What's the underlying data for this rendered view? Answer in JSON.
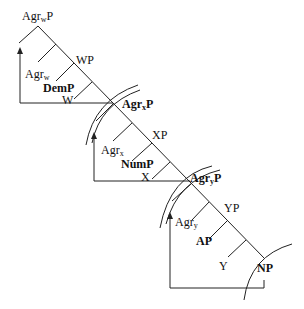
{
  "diagram": {
    "type": "syntax-tree",
    "nodes": {
      "agrw_phrase": {
        "base": "Agr",
        "sub": "w",
        "tail": "P",
        "bold": false
      },
      "wp": {
        "text": "WP",
        "bold": false
      },
      "agrw_head": {
        "base": "Agr",
        "sub": "w",
        "bold": false
      },
      "demp": {
        "text": "DemP",
        "bold": true
      },
      "w_head": {
        "text": "W",
        "bold": false
      },
      "agrx_phrase": {
        "base": "Agr",
        "sub": "x",
        "tail": "P",
        "bold": true
      },
      "xp": {
        "text": "XP",
        "bold": false
      },
      "agrx_head": {
        "base": "Agr",
        "sub": "x",
        "bold": false
      },
      "nump": {
        "text": "NumP",
        "bold": true
      },
      "x_head": {
        "text": "X",
        "bold": false
      },
      "agry_phrase": {
        "base": "Agr",
        "sub": "y",
        "tail": "P",
        "bold": true
      },
      "yp": {
        "text": "YP",
        "bold": false
      },
      "agry_head": {
        "base": "Agr",
        "sub": "y",
        "bold": false
      },
      "ap": {
        "text": "AP",
        "bold": true
      },
      "y_head": {
        "text": "Y",
        "bold": false
      },
      "np": {
        "text": "NP",
        "bold": true
      }
    },
    "movement_arrows": [
      {
        "from": "agrx_phrase",
        "to": "agrw_spec",
        "label": "movement-1"
      },
      {
        "from": "agry_phrase",
        "to": "agrx_spec",
        "label": "movement-2"
      },
      {
        "from": "np",
        "to": "agry_spec",
        "label": "movement-3"
      }
    ],
    "colors": {
      "line": "#222222",
      "text": "#111111",
      "background": "#ffffff"
    }
  }
}
